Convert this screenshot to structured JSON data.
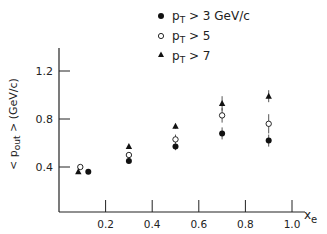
{
  "chart_data": {
    "type": "scatter",
    "title": "",
    "xlabel": "x_e",
    "ylabel": "<p_out> (GeV/c)",
    "xlim": [
      0,
      1.05
    ],
    "ylim": [
      0,
      1.4
    ],
    "xticks": [
      "0.2",
      "0.4",
      "0.6",
      "0.8",
      "1.0"
    ],
    "yticks": [
      "0.4",
      "0.8",
      "1.2"
    ],
    "grid": false,
    "legend_position": "top-right",
    "x": [
      0.1,
      0.3,
      0.5,
      0.7,
      0.9
    ],
    "series": [
      {
        "name": "p_T > 3 GeV/c",
        "marker": "filled-circle",
        "values": [
          0.36,
          0.45,
          0.57,
          0.68,
          0.62
        ],
        "err": [
          0.0,
          0.02,
          0.03,
          0.05,
          0.05
        ]
      },
      {
        "name": "p_T > 5",
        "marker": "open-circle",
        "values": [
          0.4,
          0.5,
          0.63,
          0.83,
          0.76
        ],
        "err": [
          0.0,
          0.02,
          0.04,
          0.06,
          0.08
        ]
      },
      {
        "name": "p_T > 7",
        "marker": "filled-triangle",
        "values": [
          0.36,
          0.57,
          0.74,
          0.93,
          0.99
        ],
        "err": [
          0.0,
          0.0,
          0.02,
          0.06,
          0.05
        ]
      }
    ]
  },
  "legend": {
    "items": [
      {
        "label_main": "p",
        "label_sub": "T",
        "label_rest": " > 3  GeV/c"
      },
      {
        "label_main": "p",
        "label_sub": "T",
        "label_rest": " > 5"
      },
      {
        "label_main": "p",
        "label_sub": "T",
        "label_rest": " > 7"
      }
    ]
  },
  "axes": {
    "y_label": "< p",
    "y_label_sub": "out",
    "y_label_rest": " > (GeV/c)",
    "x_label_main": "x",
    "x_label_sub": "e"
  }
}
